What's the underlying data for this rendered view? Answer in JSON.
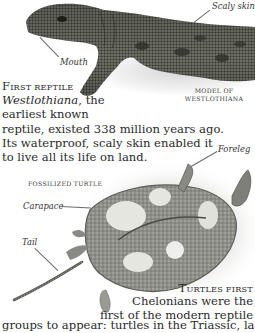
{
  "figure_1": {
    "subject": "Model of Westlothiana lizard-like reptile",
    "labels": {
      "scaly_skin": "Scaly skin",
      "mouth": "Mouth"
    },
    "model_caption_line1": "Model of",
    "model_caption_line2": "Westlothiana"
  },
  "section_1": {
    "heading_first": "F",
    "heading_rest": "irst reptile",
    "line1_italic": "Westlothiana",
    "line1_rest": ", the",
    "line2": "earliest known",
    "line3": "reptile, existed 338 million years ago.",
    "line4": "Its waterproof, scaly skin enabled it",
    "line5": "to live all its life on land."
  },
  "figure_2": {
    "subject": "Fossilized turtle",
    "title": "Fossilized turtle",
    "labels": {
      "foreleg": "Foreleg",
      "carapace": "Carapace",
      "tail": "Tail"
    }
  },
  "section_2": {
    "heading_first": "T",
    "heading_rest": "urtles first",
    "line1": "Chelonians were the",
    "line2": "first of the modern reptile",
    "line3": "groups to appear: turtles in the Triassic, land tortoises in"
  },
  "colors": {
    "text": "#2a2a2a",
    "lizard_dark": "#3c3d36",
    "lizard_mid": "#6b6c62",
    "fossil": "#8a8a84",
    "fossil_light": "#d8d8d2"
  }
}
